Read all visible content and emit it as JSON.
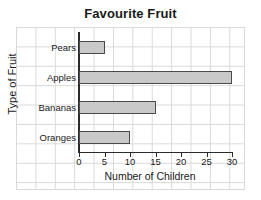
{
  "chart_data": {
    "type": "bar",
    "orientation": "horizontal",
    "title": "Favourite Fruit",
    "xlabel": "Number of Children",
    "ylabel": "Type of Fruit",
    "categories": [
      "Pears",
      "Apples",
      "Bananas",
      "Oranges"
    ],
    "values": [
      5,
      30,
      15,
      10
    ],
    "xlim": [
      0,
      30
    ],
    "xticks": [
      0,
      5,
      10,
      15,
      20,
      25,
      30
    ],
    "xtick_labels": [
      "0",
      "5",
      "10",
      "15",
      "20",
      "25",
      "30"
    ],
    "grid": true,
    "legend": null,
    "bar_fill_color": "#c9c9c9",
    "bar_edge_color": "#4a4a4a",
    "axis_color": "#2b2b2b",
    "grid_color": "#d9d9d9",
    "background_color": "#ffffff"
  }
}
